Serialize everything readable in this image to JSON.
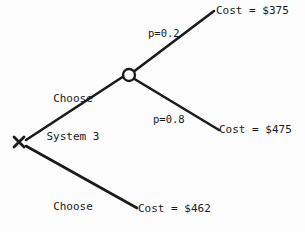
{
  "diagram": {
    "type": "decision-tree",
    "line_color": "#1a1a1a",
    "background_color": "#fcfcfc",
    "nodes": {
      "decision": {
        "marker": "X",
        "label": "X",
        "x": 19,
        "y": 142
      },
      "chance": {
        "marker": "circle",
        "x": 129,
        "y": 75,
        "radius": 6
      }
    },
    "branches": {
      "choose_system_3": {
        "label_line1": "Choose",
        "label_line2": "System 3"
      },
      "choose_system_1": {
        "label_line1": "Choose",
        "label_line2": "System 1"
      },
      "chance_high": {
        "probability_label": "p=0.2",
        "probability": 0.2,
        "outcome_label": "Cost = $375",
        "cost": 375
      },
      "chance_low": {
        "probability_label": "p=0.8",
        "probability": 0.8,
        "outcome_label": "Cost = $475",
        "cost": 475
      },
      "system_1_outcome": {
        "outcome_label": "Cost = $462",
        "cost": 462
      }
    }
  }
}
